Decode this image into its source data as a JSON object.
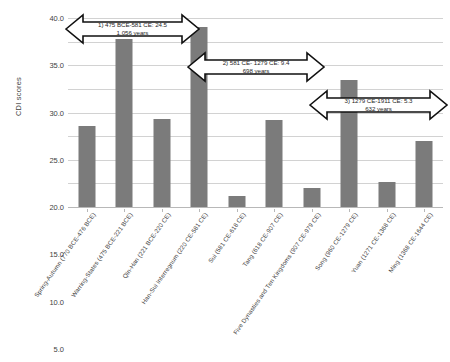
{
  "chart_data": {
    "type": "bar",
    "title": "",
    "xlabel": "",
    "ylabel": "CDI scores",
    "ylim": [
      0,
      40
    ],
    "ytick_step": 5,
    "grid": true,
    "legend": "none",
    "bar_color": "#7b7b7b",
    "gridline_color": "#d2d2d2",
    "yticks": [
      "0.0",
      "5.0",
      "10.0",
      "15.0",
      "20.0",
      "25.0",
      "30.0",
      "35.0",
      "40.0"
    ],
    "categories": [
      "Spring-Autumn (770 BCE-476 BCE)",
      "Warring-States (475 BCE-221 BCE)",
      "Qin-Han (221 BCE-220 CE)",
      "Han-Sui Interregnum (220 CE-581 CE)",
      "Sui (581 CE-618 CE)",
      "Tang (618 CE-907 CE)",
      "Five Dynasties and Ten Kingdoms (907 CE-979 CE)",
      "Song (960 CE-1279 CE)",
      "Yuan (1271 CE-1368 CE)",
      "Ming (1368 CE-1644 CE)"
    ],
    "values": [
      17.1,
      35.5,
      18.6,
      38.2,
      2.4,
      18.5,
      4.0,
      26.8,
      5.2,
      14.0
    ],
    "annotations": [
      {
        "id": "annotation-1",
        "line1": "1) 475 BCE-581 CE: 24.5",
        "line2": "1,056 years",
        "shape": "double-headed-arrow"
      },
      {
        "id": "annotation-2",
        "line1": "2) 581 CE- 1279 CE: 9.4",
        "line2": "698 years",
        "shape": "double-headed-arrow"
      },
      {
        "id": "annotation-3",
        "line1": "3) 1279 CE-1911 CE: 5.3",
        "line2": "632 years",
        "shape": "double-headed-arrow"
      }
    ]
  }
}
